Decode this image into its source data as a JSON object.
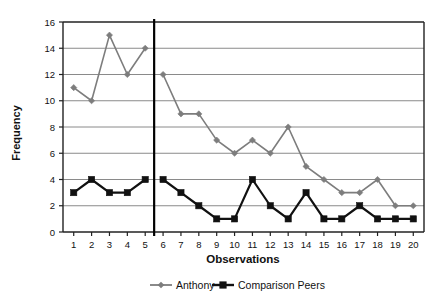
{
  "chart_data": {
    "type": "line",
    "title": "",
    "xlabel": "Observations",
    "ylabel": "Frequency",
    "x": [
      1,
      2,
      3,
      4,
      5,
      6,
      7,
      8,
      9,
      10,
      11,
      12,
      13,
      14,
      15,
      16,
      17,
      18,
      19,
      20
    ],
    "xtick_labels": [
      "1",
      "2",
      "3",
      "4",
      "5",
      "6",
      "7",
      "8",
      "9",
      "10",
      "11",
      "12",
      "13",
      "14",
      "15",
      "16",
      "17",
      "18",
      "19",
      "20"
    ],
    "ytick_labels": [
      "0",
      "2",
      "4",
      "6",
      "8",
      "10",
      "12",
      "14",
      "16"
    ],
    "ytick_values": [
      0,
      2,
      4,
      6,
      8,
      10,
      12,
      14,
      16
    ],
    "ylim": [
      0,
      16
    ],
    "xlim": [
      1,
      20
    ],
    "grid": "horizontal",
    "legend_position": "bottom",
    "series": [
      {
        "name": "Anthony",
        "color": "#7d7d7d",
        "marker": "diamond",
        "values": [
          11,
          10,
          15,
          12,
          14,
          12,
          9,
          9,
          7,
          6,
          7,
          6,
          8,
          5,
          4,
          3,
          3,
          4,
          2,
          2
        ]
      },
      {
        "name": "Comparison Peers",
        "color": "#111111",
        "marker": "square",
        "values": [
          3,
          4,
          3,
          3,
          4,
          4,
          3,
          2,
          1,
          1,
          4,
          2,
          1,
          3,
          1,
          1,
          2,
          1,
          1,
          1
        ]
      }
    ],
    "annotations": [
      {
        "type": "phase-change-line",
        "name": "phase-change-line",
        "orientation": "vertical",
        "x_between": [
          5,
          6
        ],
        "color": "#000000"
      }
    ]
  },
  "legend": {
    "items": [
      {
        "label": "Anthony",
        "color": "#7d7d7d",
        "marker": "diamond"
      },
      {
        "label": "Comparison Peers",
        "color": "#111111",
        "marker": "square"
      }
    ]
  },
  "axes": {
    "y_title": "Frequency",
    "x_title": "Observations"
  }
}
